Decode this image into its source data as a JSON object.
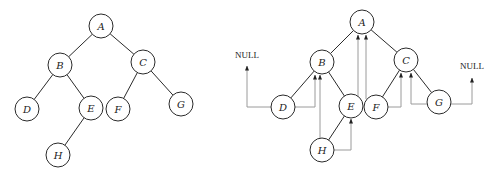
{
  "diagram": {
    "type": "binary-tree-threading",
    "colors": {
      "edge": "#2a2a2a",
      "thread": "#9a9a9a",
      "background": "#ffffff"
    },
    "node_radius": 12,
    "left_tree": {
      "nodes": [
        {
          "id": "A",
          "label": "A",
          "x": 101,
          "y": 26
        },
        {
          "id": "B",
          "label": "B",
          "x": 60,
          "y": 65
        },
        {
          "id": "C",
          "label": "C",
          "x": 143,
          "y": 62
        },
        {
          "id": "D",
          "label": "D",
          "x": 27,
          "y": 109
        },
        {
          "id": "E",
          "label": "E",
          "x": 91,
          "y": 108
        },
        {
          "id": "F",
          "label": "F",
          "x": 118,
          "y": 109
        },
        {
          "id": "G",
          "label": "G",
          "x": 181,
          "y": 104
        },
        {
          "id": "H",
          "label": "H",
          "x": 58,
          "y": 155
        }
      ],
      "edges": [
        [
          "A",
          "B"
        ],
        [
          "A",
          "C"
        ],
        [
          "B",
          "D"
        ],
        [
          "B",
          "E"
        ],
        [
          "C",
          "F"
        ],
        [
          "C",
          "G"
        ],
        [
          "E",
          "H"
        ]
      ]
    },
    "right_tree": {
      "nodes": [
        {
          "id": "A",
          "label": "A",
          "x": 362,
          "y": 22
        },
        {
          "id": "B",
          "label": "B",
          "x": 322,
          "y": 62
        },
        {
          "id": "C",
          "label": "C",
          "x": 406,
          "y": 60
        },
        {
          "id": "D",
          "label": "D",
          "x": 283,
          "y": 107
        },
        {
          "id": "E",
          "label": "E",
          "x": 351,
          "y": 106
        },
        {
          "id": "F",
          "label": "F",
          "x": 376,
          "y": 107
        },
        {
          "id": "G",
          "label": "G",
          "x": 439,
          "y": 102
        },
        {
          "id": "H",
          "label": "H",
          "x": 322,
          "y": 150
        }
      ],
      "edges": [
        [
          "A",
          "B"
        ],
        [
          "A",
          "C"
        ],
        [
          "B",
          "D"
        ],
        [
          "B",
          "E"
        ],
        [
          "C",
          "F"
        ],
        [
          "C",
          "G"
        ],
        [
          "E",
          "H"
        ]
      ],
      "threads": [
        {
          "from": "D",
          "to": "NULL",
          "side": "left",
          "path": "M271,107 H247 V66"
        },
        {
          "from": "D",
          "to": "B",
          "side": "right",
          "path": "M295,107 H315 V75"
        },
        {
          "from": "H",
          "to": "B",
          "side": "left",
          "path": "M320,138 V75"
        },
        {
          "from": "H",
          "to": "E",
          "side": "right",
          "path": "M334,150 H351 V119"
        },
        {
          "from": "E",
          "to": "A",
          "side": "right",
          "path": "M358,96 V35"
        },
        {
          "from": "F",
          "to": "A",
          "side": "left",
          "path": "M366,99 V35"
        },
        {
          "from": "F",
          "to": "C",
          "side": "right",
          "path": "M388,107 H401 V73"
        },
        {
          "from": "G",
          "to": "C",
          "side": "left",
          "path": "M427,104 H411 V73"
        },
        {
          "from": "G",
          "to": "NULL",
          "side": "right",
          "path": "M451,104 H472 V78"
        }
      ],
      "null_labels": [
        {
          "text": "NULL",
          "x": 247,
          "y": 58
        },
        {
          "text": "NULL",
          "x": 472,
          "y": 69
        }
      ]
    }
  }
}
